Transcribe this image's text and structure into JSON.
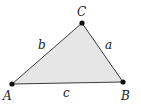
{
  "diagram": {
    "type": "triangle",
    "fill_color": "#e6e6e6",
    "stroke_color": "#3a3a3a",
    "vertex_color": "#111111",
    "vertices": [
      {
        "id": "A",
        "label": "A",
        "x": 12,
        "y": 84
      },
      {
        "id": "B",
        "label": "B",
        "x": 123,
        "y": 82
      },
      {
        "id": "C",
        "label": "C",
        "x": 82,
        "y": 23
      }
    ],
    "sides": [
      {
        "id": "a",
        "label": "a",
        "between": [
          "B",
          "C"
        ]
      },
      {
        "id": "b",
        "label": "b",
        "between": [
          "A",
          "C"
        ]
      },
      {
        "id": "c",
        "label": "c",
        "between": [
          "A",
          "B"
        ]
      }
    ]
  }
}
